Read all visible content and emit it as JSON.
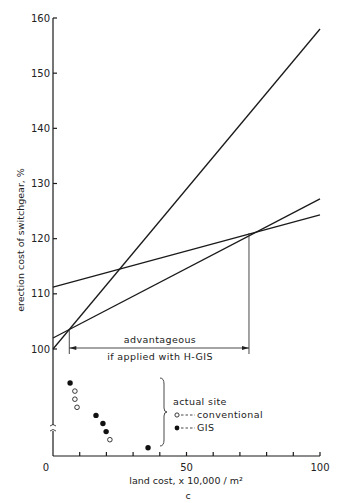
{
  "chart_data": {
    "type": "line",
    "title": "",
    "xlabel": "land cost, x 10,000 / m²",
    "xlabel_sub": "c",
    "ylabel": "erection cost of switchgear, %",
    "xlim": [
      0,
      100
    ],
    "ylim": [
      100,
      160
    ],
    "grid": false,
    "x_ticks": [
      0,
      10,
      20,
      30,
      40,
      50,
      60,
      70,
      80,
      90,
      100
    ],
    "x_tick_labels": [
      "0",
      "50",
      "100"
    ],
    "x_tick_label_values": [
      0,
      50,
      100
    ],
    "y_ticks": [
      100,
      110,
      120,
      130,
      140,
      150,
      160
    ],
    "y_tick_labels": [
      "100",
      "110",
      "120",
      "130",
      "140",
      "150",
      "160"
    ],
    "y_axis_break": true,
    "series": [
      {
        "name": "line-steep",
        "x": [
          0,
          100
        ],
        "y": [
          100,
          158
        ]
      },
      {
        "name": "line-middle",
        "x": [
          0,
          100
        ],
        "y": [
          102,
          127.2
        ]
      },
      {
        "name": "line-flat",
        "x": [
          0,
          100
        ],
        "y": [
          111.2,
          124.3
        ]
      }
    ],
    "annotations": {
      "advantage_line1": "advantageous",
      "advantage_line2": "if applied with H-GIS",
      "advantage_range_x": [
        6.1,
        73.4
      ],
      "advantage_y_level": 103.5
    },
    "scatter_below_break": {
      "note": "points plotted in broken-axis region below 100%, y given as relative rank (1 = top)",
      "points": [
        {
          "type": "GIS",
          "x": 6.4,
          "rank": 1
        },
        {
          "type": "conventional",
          "x": 8.2,
          "rank": 2
        },
        {
          "type": "conventional",
          "x": 8.2,
          "rank": 3
        },
        {
          "type": "conventional",
          "x": 9.0,
          "rank": 4
        },
        {
          "type": "GIS",
          "x": 16.1,
          "rank": 5
        },
        {
          "type": "GIS",
          "x": 18.7,
          "rank": 6
        },
        {
          "type": "GIS",
          "x": 19.9,
          "rank": 7
        },
        {
          "type": "conventional",
          "x": 21.3,
          "rank": 8
        },
        {
          "type": "GIS",
          "x": 35.6,
          "rank": 9
        }
      ]
    },
    "legend": {
      "title": "actual site",
      "entries": [
        {
          "marker": "open-circle",
          "label": "conventional"
        },
        {
          "marker": "filled-circle",
          "label": "GIS"
        }
      ],
      "placement": "bottom-center"
    }
  }
}
